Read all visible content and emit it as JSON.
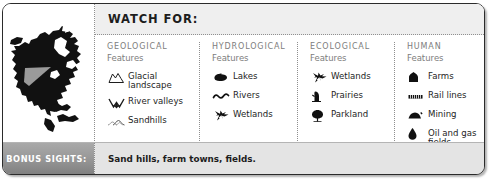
{
  "card": {
    "header": {
      "title": "WATCH FOR:"
    },
    "map": {
      "icon": "north-america-map-icon",
      "highlight_color": "#9a9a9a",
      "land_color": "#111111"
    },
    "columns": [
      {
        "title": "GEOLOGICAL",
        "subtitle": "Features",
        "items": [
          {
            "icon": "glacial-landscape-icon",
            "label": "Glacial\nlandscape"
          },
          {
            "icon": "river-valleys-icon",
            "label": "River valleys"
          },
          {
            "icon": "sandhills-icon",
            "label": "Sandhills"
          }
        ]
      },
      {
        "title": "HYDROLOGICAL",
        "subtitle": "Features",
        "items": [
          {
            "icon": "lakes-icon",
            "label": "Lakes"
          },
          {
            "icon": "rivers-icon",
            "label": "Rivers"
          },
          {
            "icon": "wetlands-icon",
            "label": "Wetlands"
          }
        ]
      },
      {
        "title": "ECOLOGICAL",
        "subtitle": "Features",
        "items": [
          {
            "icon": "wetlands-icon",
            "label": "Wetlands"
          },
          {
            "icon": "prairies-icon",
            "label": "Prairies"
          },
          {
            "icon": "parkland-icon",
            "label": "Parkland"
          }
        ]
      },
      {
        "title": "HUMAN",
        "subtitle": "Features",
        "items": [
          {
            "icon": "farms-icon",
            "label": "Farms"
          },
          {
            "icon": "rail-lines-icon",
            "label": "Rail lines"
          },
          {
            "icon": "mining-icon",
            "label": "Mining"
          },
          {
            "icon": "oil-and-gas-icon",
            "label": "Oil and gas\nfields"
          }
        ]
      }
    ],
    "bonus": {
      "label": "BONUS SIGHTS:",
      "text": "Sand hills, farm towns, fields."
    }
  }
}
